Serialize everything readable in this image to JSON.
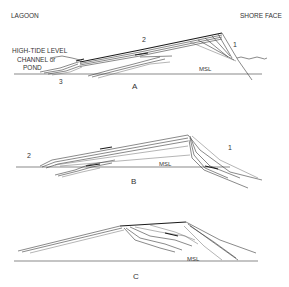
{
  "figure": {
    "panels": [
      {
        "id": "A",
        "label": "A",
        "labels": {
          "lagoon": "LAGOON",
          "shore_face": "SHORE FACE",
          "high_tide_level": "HIGH-TIDE LEVEL",
          "channel_line1": "CHANNEL or",
          "channel_line2": "POND",
          "msl": "MSL",
          "num1": "1",
          "num2": "2",
          "num3": "3"
        }
      },
      {
        "id": "B",
        "label": "B",
        "labels": {
          "msl": "MSL",
          "num1": "1",
          "num2": "2"
        }
      },
      {
        "id": "C",
        "label": "C",
        "labels": {
          "msl": "MSL"
        }
      }
    ]
  },
  "colors": {
    "background": "#ffffff",
    "ink": "#333333"
  }
}
